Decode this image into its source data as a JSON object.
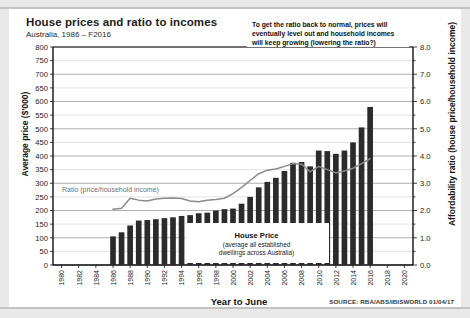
{
  "header": {
    "title": "House prices and ratio to incomes",
    "subtitle": "Australia, 1986 – F2016"
  },
  "annotations": {
    "forecast_note": "To get the ratio back to normal, prices will eventually level out and household incomes will keep growing (lowering the ratio?)",
    "series_label_bars_line1": "House Price",
    "series_label_bars_line2": "(average all established",
    "series_label_bars_line3": "dwellings across Australia)",
    "series_label_line": "Ratio (price/household income)"
  },
  "footer": {
    "source": "SOURCE: RBA/ABS/IBISWORLD 01/04/17"
  },
  "colors": {
    "bar": "#2b2b2b",
    "line": "#8a8a8a",
    "axis": "#111111",
    "grid": "#d0d0d0",
    "page_background": "#e9e9e9",
    "card_background": "#ffffff"
  },
  "chart_data": {
    "type": "bar",
    "title": "House prices and ratio to incomes",
    "subtitle": "Australia, 1986 – F2016",
    "xlabel": "Year to June",
    "ylabel": "Average price ($'000)",
    "y2label": "Affordability ratio (house price/household income)",
    "ylim": [
      0,
      800
    ],
    "y2lim": [
      0.0,
      8.0
    ],
    "ytick_step": 50,
    "y2tick_step": 1.0,
    "grid": true,
    "legend_position": "inline-annotations",
    "xlim": [
      1979,
      2021
    ],
    "xticks": [
      1980,
      1982,
      1984,
      1986,
      1988,
      1990,
      1992,
      1994,
      1996,
      1998,
      2000,
      2002,
      2004,
      2006,
      2008,
      2010,
      2012,
      2014,
      2016,
      2018,
      2020
    ],
    "x": [
      1986,
      1987,
      1988,
      1989,
      1990,
      1991,
      1992,
      1993,
      1994,
      1995,
      1996,
      1997,
      1998,
      1999,
      2000,
      2001,
      2002,
      2003,
      2004,
      2005,
      2006,
      2007,
      2008,
      2009,
      2010,
      2011,
      2012,
      2013,
      2014,
      2015,
      2016
    ],
    "series": [
      {
        "name": "House Price",
        "type": "bar",
        "axis": "left",
        "unit": "$'000",
        "values": [
          105,
          120,
          145,
          163,
          165,
          168,
          172,
          175,
          180,
          183,
          190,
          192,
          200,
          205,
          207,
          225,
          250,
          285,
          305,
          320,
          345,
          375,
          378,
          362,
          420,
          418,
          408,
          420,
          450,
          505,
          580
        ]
      },
      {
        "name": "Ratio (price/household income)",
        "type": "line",
        "axis": "right",
        "unit": "ratio",
        "values": [
          2.05,
          2.08,
          2.45,
          2.38,
          2.35,
          2.42,
          2.45,
          2.46,
          2.44,
          2.35,
          2.32,
          2.38,
          2.4,
          2.45,
          2.62,
          2.85,
          3.1,
          3.35,
          3.48,
          3.52,
          3.62,
          3.72,
          3.7,
          3.42,
          3.62,
          3.5,
          3.38,
          3.45,
          3.55,
          3.72,
          3.9
        ]
      }
    ]
  }
}
